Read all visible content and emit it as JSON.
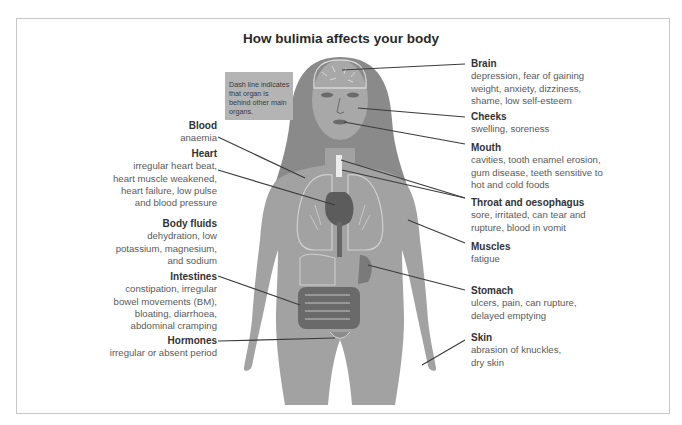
{
  "title": "How bulimia affects your body",
  "note": "Dash line indicates that organ is behind other main  organs.",
  "colors": {
    "body": "#a2a2a2",
    "hair": "#8a8a8a",
    "organ_outline": "#d8d8d8",
    "organ_dark": "#6a6a6a",
    "leader_line": "#3c3c3c",
    "note_bg": "#b4b4b4",
    "frame": "#c8c8c8"
  },
  "left_labels": [
    {
      "heading": "Blood",
      "lines": [
        "anaemia"
      ]
    },
    {
      "heading": "Heart",
      "lines": [
        "irregular heart beat,",
        "heart muscle weakened,",
        "heart failure, low pulse",
        "and blood pressure"
      ]
    },
    {
      "heading": "Body fluids",
      "lines": [
        "dehydration, low",
        "potassium, magnesium,",
        "and sodium"
      ]
    },
    {
      "heading": "Intestines",
      "lines": [
        "constipation, irregular",
        "bowel movements (BM),",
        "bloating, diarrhoea,",
        "abdominal cramping"
      ]
    },
    {
      "heading": "Hormones",
      "lines": [
        "irregular or absent period"
      ]
    }
  ],
  "right_labels": [
    {
      "heading": "Brain",
      "lines": [
        "depression, fear of gaining",
        "weight, anxiety, dizziness,",
        "shame, low self-esteem"
      ]
    },
    {
      "heading": "Cheeks",
      "lines": [
        "swelling, soreness"
      ]
    },
    {
      "heading": "Mouth",
      "lines": [
        "cavities, tooth enamel erosion,",
        "gum disease, teeth sensitive to",
        "hot and cold foods"
      ]
    },
    {
      "heading": "Throat and oesophagus",
      "lines": [
        "sore, irritated, can tear and",
        "rupture, blood in vomit"
      ]
    },
    {
      "heading": "Muscles",
      "lines": [
        "fatigue"
      ]
    },
    {
      "heading": "Stomach",
      "lines": [
        "ulcers, pain, can rupture,",
        "delayed emptying"
      ]
    },
    {
      "heading": "Skin",
      "lines": [
        "abrasion of knuckles,",
        "dry skin"
      ]
    }
  ]
}
